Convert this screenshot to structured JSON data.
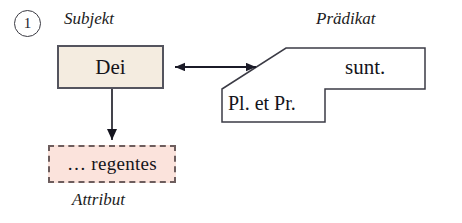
{
  "figure": {
    "number": "1",
    "number_icon": "circled-number-icon"
  },
  "labels": {
    "subject": "Subjekt",
    "predicate": "Prädikat",
    "attribute": "Attribut"
  },
  "nodes": {
    "subject_text": "Dei",
    "predicate_verb": "sunt.",
    "predicate_features": "Pl. et Pr.",
    "attribute_text": "… regentes"
  },
  "colors": {
    "subject_fill": "#f4ece0",
    "subject_border": "#54545e",
    "attribute_fill": "#fbe3dc",
    "attribute_border": "#6d5d5d",
    "predicate_fill": "#ffffff",
    "predicate_border": "#3b3b45",
    "arrow": "#1b1b28",
    "page_background": "#ffffff"
  },
  "connectors": [
    {
      "name": "subject-predicate-link",
      "style": "double-headed-arrow",
      "from": "Dei",
      "to": "Prädikat"
    },
    {
      "name": "subject-attribute-link",
      "style": "single-headed-arrow-down",
      "from": "Dei",
      "to": "… regentes"
    }
  ]
}
